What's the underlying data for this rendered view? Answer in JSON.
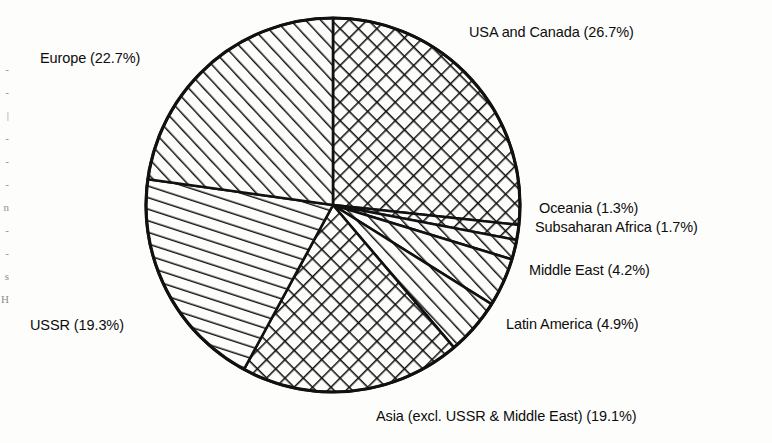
{
  "chart_data": {
    "type": "pie",
    "title": "",
    "xlabel": "",
    "ylabel": "",
    "legend_position": "none",
    "grid": false,
    "units": "percent",
    "start_angle_deg": 0,
    "direction": "clockwise",
    "center": {
      "x": 333,
      "y": 205
    },
    "radius": 187,
    "categories": [
      "USA and Canada",
      "Oceania",
      "Subsaharan Africa",
      "Middle East",
      "Latin America",
      "Asia (excl. USSR & Middle East)",
      "USSR",
      "Europe"
    ],
    "values": [
      26.7,
      1.3,
      1.7,
      4.2,
      4.9,
      19.1,
      19.3,
      22.7
    ],
    "slices": [
      {
        "name": "USA and Canada",
        "value": 26.7,
        "label": "USA and Canada (26.7%)",
        "pattern": "cross-hatch",
        "start_deg": 0,
        "end_deg": 96.12
      },
      {
        "name": "Oceania",
        "value": 1.3,
        "label": "Oceania (1.3%)",
        "pattern": "cross-hatch",
        "start_deg": 96.12,
        "end_deg": 100.8
      },
      {
        "name": "Subsaharan Africa",
        "value": 1.7,
        "label": "Subsaharan Africa (1.7%)",
        "pattern": "diagonal-hatch",
        "start_deg": 100.8,
        "end_deg": 106.92
      },
      {
        "name": "Middle East",
        "value": 4.2,
        "label": "Middle East (4.2%)",
        "pattern": "diagonal-hatch",
        "start_deg": 106.92,
        "end_deg": 122.04
      },
      {
        "name": "Latin America",
        "value": 4.9,
        "label": "Latin America (4.9%)",
        "pattern": "diagonal-hatch",
        "start_deg": 122.04,
        "end_deg": 139.68
      },
      {
        "name": "Asia (excl. USSR & Middle East)",
        "value": 19.1,
        "label": "Asia (excl. USSR & Middle East) (19.1%)",
        "pattern": "cross-hatch",
        "start_deg": 139.68,
        "end_deg": 208.44
      },
      {
        "name": "USSR",
        "value": 19.3,
        "label": "USSR (19.3%)",
        "pattern": "diagonal-hatch",
        "start_deg": 208.44,
        "end_deg": 277.92
      },
      {
        "name": "Europe",
        "value": 22.7,
        "label": "Europe (22.7%)",
        "pattern": "diagonal-hatch",
        "start_deg": 277.92,
        "end_deg": 360
      }
    ]
  },
  "labels": {
    "europe": "Europe (22.7%)",
    "usa_canada": "USA and Canada (26.7%)",
    "oceania": "Oceania (1.3%)",
    "subsaharan_africa": "Subsaharan Africa (1.7%)",
    "middle_east": "Middle East (4.2%)",
    "latin_america": "Latin America (4.9%)",
    "ussr": "USSR (19.3%)",
    "asia": "Asia (excl. USSR & Middle East) (19.1%)"
  },
  "colors": {
    "background": "#fdfdfc",
    "ink": "#101010",
    "hatch": "#111111"
  },
  "scan_artifacts": {
    "left_margin_fragments": "-\n-\n|\n-\n-\n-\nn\n-\n-\ns\nH"
  }
}
